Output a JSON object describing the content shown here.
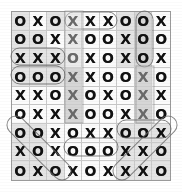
{
  "puzzle": {
    "title": "Tic-Tac-Toe Word Search Grid",
    "rows": 9,
    "cols": 9,
    "symbols": [
      "O",
      "X"
    ],
    "grid": [
      [
        "O",
        "X",
        "O",
        "X",
        "X",
        "X",
        "O",
        "O",
        "X"
      ],
      [
        "O",
        "O",
        "X",
        "X",
        "O",
        "O",
        "X",
        "O",
        "O"
      ],
      [
        "X",
        "X",
        "X",
        "O",
        "X",
        "O",
        "X",
        "O",
        "X"
      ],
      [
        "O",
        "O",
        "O",
        "X",
        "X",
        "O",
        "O",
        "X",
        "O"
      ],
      [
        "X",
        "X",
        "O",
        "X",
        "O",
        "X",
        "O",
        "X",
        "X"
      ],
      [
        "O",
        "X",
        "X",
        "X",
        "O",
        "O",
        "X",
        "X",
        "O"
      ],
      [
        "O",
        "O",
        "X",
        "O",
        "X",
        "X",
        "O",
        "O",
        "X"
      ],
      [
        "X",
        "O",
        "X",
        "O",
        "O",
        "O",
        "X",
        "X",
        "O"
      ],
      [
        "O",
        "X",
        "O",
        "X",
        "O",
        "X",
        "X",
        "X",
        "O"
      ]
    ],
    "shading": [
      [
        "b",
        "a",
        "b",
        "a",
        "a",
        "a",
        "b",
        "c",
        "a"
      ],
      [
        "b",
        "b",
        "a",
        "a",
        "a",
        "a",
        "b",
        "c",
        "a"
      ],
      [
        "b",
        "b",
        "b",
        "a",
        "a",
        "a",
        "b",
        "c",
        "a"
      ],
      [
        "b",
        "b",
        "b",
        "c",
        "a",
        "a",
        "a",
        "c",
        "a"
      ],
      [
        "a",
        "a",
        "a",
        "c",
        "a",
        "a",
        "a",
        "c",
        "a"
      ],
      [
        "a",
        "a",
        "a",
        "c",
        "a",
        "a",
        "a",
        "c",
        "a"
      ],
      [
        "b",
        "b",
        "a",
        "a",
        "a",
        "a",
        "b",
        "b",
        "b"
      ],
      [
        "b",
        "b",
        "a",
        "a",
        "a",
        "a",
        "b",
        "b",
        "b"
      ],
      [
        "b",
        "b",
        "b",
        "a",
        "a",
        "a",
        "b",
        "b",
        "b"
      ]
    ],
    "found_marks": [
      {
        "id": "mark-row1-c4-c6",
        "label": "XXX across row 1 columns 4-6",
        "shape": "oval-horizontal",
        "x": 65,
        "y": 12,
        "w": 52,
        "h": 17,
        "rotation": 0
      },
      {
        "id": "mark-row3-c1-c3",
        "label": "XXX across row 3 columns 1-3",
        "shape": "oval-horizontal",
        "x": 11,
        "y": 48,
        "w": 54,
        "h": 17,
        "rotation": 0
      },
      {
        "id": "mark-row4-c1-c3",
        "label": "OOO across row 4 columns 1-3",
        "shape": "oval-horizontal",
        "x": 11,
        "y": 66,
        "w": 54,
        "h": 18,
        "rotation": 0
      },
      {
        "id": "mark-row8-c4-c6",
        "label": "OOO across row 8 columns 4-6",
        "shape": "oval-horizontal",
        "x": 64,
        "y": 138,
        "w": 54,
        "h": 18,
        "rotation": 0
      },
      {
        "id": "mark-col8-r1-r3",
        "label": "OOO down column 8 rows 1-3",
        "shape": "oval-vertical",
        "x": 136,
        "y": 11,
        "w": 17,
        "h": 56,
        "rotation": 0
      },
      {
        "id": "mark-col4-r1-r6",
        "label": "Column 4 highlighted band rows 1-6",
        "shape": "band-vertical",
        "x": 65,
        "y": 11,
        "w": 18,
        "h": 112,
        "rotation": 0
      },
      {
        "id": "mark-col8-r4-r6",
        "label": "Column 8 highlighted band rows 4-6",
        "shape": "band-vertical",
        "x": 136,
        "y": 66,
        "w": 18,
        "h": 57,
        "rotation": 0
      },
      {
        "id": "mark-diag-r7c1-r9c3",
        "label": "OOO diagonal from row 7 column 1 to row 9 column 3",
        "shape": "oval-diagonal-down",
        "x": 11,
        "y": 120,
        "w": 56,
        "h": 56,
        "rotation": 45
      },
      {
        "id": "mark-diag-r7c9-r9c7",
        "label": "XXX diagonal from row 7 column 9 to row 9 column 7",
        "shape": "oval-diagonal-up",
        "x": 117,
        "y": 120,
        "w": 56,
        "h": 56,
        "rotation": -45
      },
      {
        "id": "mark-row7-c7-c9",
        "label": "OOX row 7 columns 7-9",
        "shape": "oval-horizontal",
        "x": 117,
        "y": 120,
        "w": 54,
        "h": 18,
        "rotation": 0
      }
    ],
    "colors": {
      "background": "#ffffff",
      "grid_fill": "#f2f2f2",
      "grid_line": "#c9c9c9",
      "border": "#9a9a9a",
      "glyph": "#101010",
      "highlight_shade": "#d6d6d6",
      "mark_stroke": "#6b6b6b"
    }
  }
}
